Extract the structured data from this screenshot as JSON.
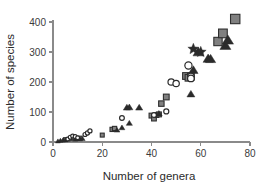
{
  "chart_data": {
    "type": "scatter",
    "title": "",
    "xlabel": "Number of genera",
    "ylabel": "Number of species",
    "xlim": [
      0,
      80
    ],
    "ylim": [
      0,
      430
    ],
    "xticks": [
      0,
      20,
      40,
      60,
      80
    ],
    "yticks": [
      0,
      100,
      200,
      300,
      400
    ],
    "xtick_labels": [
      "0",
      "20",
      "40",
      "60",
      "80"
    ],
    "ytick_labels": [
      "0",
      "100",
      "200",
      "300",
      "400"
    ],
    "grid": false,
    "legend": "none",
    "series": [
      {
        "name": "squares",
        "marker": "square",
        "fill": "#808080",
        "edge": "#2e2e2e",
        "points": [
          [
            5,
            8
          ],
          [
            8,
            14
          ],
          [
            10,
            12
          ],
          [
            11,
            13
          ],
          [
            20,
            23
          ],
          [
            24,
            42
          ],
          [
            25,
            45
          ],
          [
            40,
            88
          ],
          [
            41,
            78
          ],
          [
            42,
            90
          ],
          [
            43,
            92
          ],
          [
            44,
            128
          ],
          [
            46,
            150
          ],
          [
            54,
            220
          ],
          [
            55,
            214
          ],
          [
            56,
            218
          ],
          [
            67,
            335
          ],
          [
            69,
            362
          ],
          [
            74,
            410
          ]
        ]
      },
      {
        "name": "triangles",
        "marker": "triangle",
        "fill": "#2b2b2b",
        "edge": "#2b2b2b",
        "points": [
          [
            2,
            3
          ],
          [
            3,
            5
          ],
          [
            4,
            6
          ],
          [
            5,
            7
          ],
          [
            6,
            9
          ],
          [
            7,
            10
          ],
          [
            9,
            9
          ],
          [
            10,
            11
          ],
          [
            11,
            10
          ],
          [
            12,
            11
          ],
          [
            26,
            40
          ],
          [
            28,
            48
          ],
          [
            30,
            115
          ],
          [
            31,
            116
          ],
          [
            31,
            63
          ],
          [
            35,
            115
          ],
          [
            43,
            95
          ],
          [
            56,
            160
          ],
          [
            57,
            240
          ],
          [
            59,
            300
          ],
          [
            63,
            278
          ],
          [
            64,
            277
          ],
          [
            70,
            322
          ],
          [
            71,
            340
          ]
        ]
      },
      {
        "name": "circles",
        "marker": "circle",
        "fill": "#ffffff",
        "edge": "#2b2b2b",
        "points": [
          [
            6,
            10
          ],
          [
            7,
            16
          ],
          [
            8,
            20
          ],
          [
            9,
            18
          ],
          [
            10,
            14
          ],
          [
            13,
            25
          ],
          [
            14,
            30
          ],
          [
            15,
            37
          ],
          [
            28,
            80
          ],
          [
            41,
            90
          ],
          [
            46,
            102
          ],
          [
            48,
            200
          ],
          [
            50,
            195
          ],
          [
            55,
            255
          ],
          [
            56,
            218
          ],
          [
            56,
            212
          ]
        ]
      },
      {
        "name": "stars",
        "marker": "star",
        "fill": "#2b2b2b",
        "edge": "#2b2b2b",
        "points": [
          [
            57,
            310
          ],
          [
            60,
            300
          ]
        ]
      }
    ]
  },
  "colors": {
    "axis": "#8a8a8a",
    "text": "#2b2b2b",
    "square_fill": "#808080",
    "marker_dark": "#2b2b2b",
    "background": "#ffffff"
  }
}
